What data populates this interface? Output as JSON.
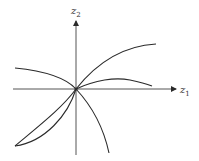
{
  "diagram": {
    "axes": {
      "x_label": "z",
      "x_sub": "1",
      "y_label": "z",
      "y_sub": "2",
      "origin": [
        76,
        89
      ]
    },
    "colors": {
      "stroke": "#2a2a2a",
      "background": "#ffffff"
    },
    "curves": [
      {
        "name": "curve-upper-left-to-lower-right",
        "path": "M15,68 C45,71 66,78 76,89 C90,104 103,125 109,153"
      },
      {
        "name": "curve-origin-to-upper-right",
        "path": "M76,89 C95,65 120,46 156,44"
      },
      {
        "name": "curve-origin-hump-right",
        "path": "M76,89 C95,80 115,77 130,80 C140,82 147,84 152,86"
      },
      {
        "name": "lens-lower-left-outer",
        "path": "M76,89 C62,108 40,125 15,146"
      },
      {
        "name": "lens-lower-left-inner",
        "path": "M76,89 C68,115 45,142 15,146"
      }
    ]
  }
}
